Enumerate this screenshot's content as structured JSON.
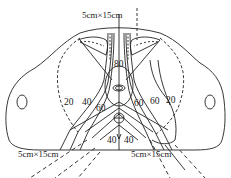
{
  "figure": {
    "type": "radiotherapy isodose distribution (pelvic cross-section)",
    "colors": {
      "line": "#222222",
      "background": "#ffffff"
    }
  },
  "fields": [
    {
      "id": "anterior",
      "label": "5cm×15cm"
    },
    {
      "id": "left-posterior-oblique",
      "label": "5cm×15cm"
    },
    {
      "id": "right-posterior-oblique",
      "label": "5cm×15cm"
    }
  ],
  "isodose_labels": {
    "center": "80",
    "left": [
      "20",
      "40",
      "60"
    ],
    "right": [
      "60",
      "60",
      "20"
    ],
    "bottom": [
      "40",
      "40"
    ]
  }
}
